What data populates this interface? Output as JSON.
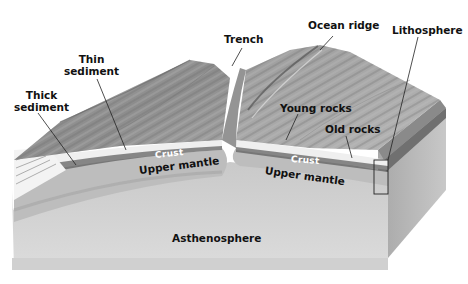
{
  "diagram": {
    "type": "geologic-block-diagram",
    "style": "grayscale illustration",
    "labels": {
      "thick_sediment": [
        "Thick",
        "sediment"
      ],
      "thin_sediment": [
        "Thin",
        "sediment"
      ],
      "trench": "Trench",
      "ocean_ridge": "Ocean ridge",
      "lithosphere": "Lithosphere",
      "young_rocks": "Young rocks",
      "old_rocks": "Old rocks",
      "crust_left": "Crust",
      "crust_right": "Crust",
      "upper_mantle_left": "Upper mantle",
      "upper_mantle_right": "Upper mantle",
      "asthenosphere": "Asthenosphere"
    },
    "colors": {
      "surface": "#9a9a9a",
      "surface_dark": "#6e6e6e",
      "crust": "#f2f2f2",
      "upper_mantle": "#c4c4c4",
      "asthenosphere": "#d6d6d6",
      "side_face": "#b3b3b3",
      "leader_line": "#222222"
    }
  }
}
